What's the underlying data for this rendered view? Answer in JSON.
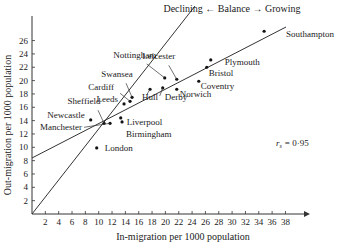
{
  "chart_data": {
    "type": "scatter",
    "title": "",
    "annotation_top": "Declining ← Balance → Growing",
    "correlation_label": "r_s = 0·95",
    "correlation_symbol": "r",
    "correlation_subscript": "s",
    "correlation_value": "= 0·95",
    "xlabel": "In-migration per 1000 population",
    "ylabel": "Out-migration per 1000 population",
    "xlim": [
      0,
      40
    ],
    "ylim": [
      0,
      28
    ],
    "x_ticks": [
      2,
      4,
      6,
      8,
      10,
      12,
      14,
      16,
      18,
      20,
      22,
      24,
      26,
      28,
      30,
      32,
      34,
      36,
      38
    ],
    "y_ticks": [
      2,
      4,
      6,
      8,
      10,
      12,
      14,
      16,
      18,
      20,
      22,
      24,
      26
    ],
    "grid": false,
    "points": [
      {
        "name": "Southampton",
        "x": 34.8,
        "y": 27.4
      },
      {
        "name": "Plymouth",
        "x": 26.8,
        "y": 23.1
      },
      {
        "name": "Bristol",
        "x": 26.2,
        "y": 22.0
      },
      {
        "name": "Coventry",
        "x": 25.0,
        "y": 19.9
      },
      {
        "name": "Leicester",
        "x": 21.7,
        "y": 20.2
      },
      {
        "name": "Norwich",
        "x": 21.7,
        "y": 18.7
      },
      {
        "name": "Nottingham",
        "x": 19.9,
        "y": 20.4
      },
      {
        "name": "Derby",
        "x": 19.6,
        "y": 18.9
      },
      {
        "name": "Hull",
        "x": 17.7,
        "y": 18.7
      },
      {
        "name": "Swansea",
        "x": 15.0,
        "y": 17.5
      },
      {
        "name": "Cardiff",
        "x": 14.7,
        "y": 16.9
      },
      {
        "name": "Leeds",
        "x": 13.8,
        "y": 16.5
      },
      {
        "name": "Sheffield",
        "x": 10.8,
        "y": 13.6
      },
      {
        "name": "Newcastle",
        "x": 8.8,
        "y": 14.1
      },
      {
        "name": "Manchester",
        "x": 11.7,
        "y": 13.6
      },
      {
        "name": "Liverpool",
        "x": 13.3,
        "y": 14.4
      },
      {
        "name": "Birmingham",
        "x": 13.5,
        "y": 13.8
      },
      {
        "name": "London",
        "x": 9.7,
        "y": 9.9
      }
    ],
    "lines": [
      {
        "name": "Balance line (in = out)",
        "x1": 0,
        "y1": 0,
        "x2": 23,
        "y2": 31
      },
      {
        "name": "Regression line",
        "x1": 0,
        "y1": 8.4,
        "x2": 36,
        "y2": 28
      }
    ],
    "caption": "Figure 3"
  }
}
